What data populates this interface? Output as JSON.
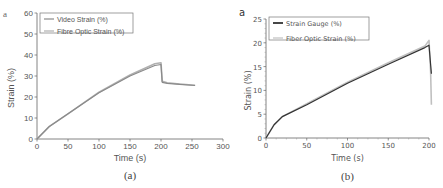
{
  "chart_data": [
    {
      "type": "line",
      "panel_letter": "a",
      "caption": "(a)",
      "title": "",
      "xlabel": "Time (s)",
      "ylabel": "Strain (%)",
      "xlim": [
        0,
        300
      ],
      "ylim": [
        0,
        60
      ],
      "xticks": [
        "0",
        "50",
        "100",
        "150",
        "200",
        "250",
        "300"
      ],
      "yticks": [
        "0",
        "10",
        "20",
        "30",
        "40",
        "50",
        "60"
      ],
      "grid": false,
      "legend_position": "upper-left",
      "series": [
        {
          "name": "Video Strain (%)",
          "color": "#8a8a8a",
          "x": [
            0,
            20,
            50,
            100,
            150,
            190,
            200,
            202,
            210,
            230,
            255
          ],
          "y": [
            0,
            6,
            12,
            22,
            30,
            35,
            35.5,
            27,
            26.5,
            26,
            25.5
          ]
        },
        {
          "name": "Fibre Optic Strain (%)",
          "color": "#b0b0b0",
          "x": [
            0,
            20,
            50,
            100,
            150,
            190,
            200,
            202,
            210,
            230,
            255
          ],
          "y": [
            0,
            6,
            12,
            22.3,
            30.5,
            35.8,
            36.3,
            27.5,
            26.8,
            26.2,
            25.6
          ]
        }
      ]
    },
    {
      "type": "line",
      "panel_letter": "a",
      "caption": "(b)",
      "title": "",
      "xlabel": "Time (s)",
      "ylabel": "Strain (%)",
      "xlim": [
        0,
        200
      ],
      "ylim": [
        0,
        25
      ],
      "xticks": [
        "0",
        "50",
        "100",
        "150",
        "200"
      ],
      "yticks": [
        "0",
        "5",
        "10",
        "15",
        "20",
        "25"
      ],
      "grid": false,
      "legend_position": "upper-left",
      "series": [
        {
          "name": "Strain Gauge (%)",
          "color": "#333333",
          "x": [
            0,
            10,
            20,
            50,
            100,
            150,
            195,
            200,
            203
          ],
          "y": [
            0,
            2.8,
            4.5,
            7,
            11.5,
            15.5,
            19,
            19.5,
            13.5
          ]
        },
        {
          "name": "Fiber Optic Strain (%)",
          "color": "#c0c0c0",
          "x": [
            0,
            10,
            20,
            50,
            100,
            150,
            195,
            200,
            202,
            203
          ],
          "y": [
            0,
            2.8,
            4.5,
            7.2,
            11.7,
            15.8,
            19.3,
            20.5,
            14,
            7
          ]
        }
      ]
    }
  ]
}
